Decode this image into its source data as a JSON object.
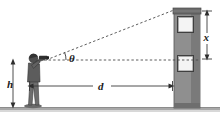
{
  "figure": {
    "background_color": "#ffffff",
    "line_color": "#3a3a3a",
    "ground_color": "#9a9a9a",
    "building_color": "#8a8a8a",
    "building_dark_color": "#6e6e6e",
    "window_color": "#f2f2f2",
    "person_color": "#4a4a4a"
  },
  "labels": {
    "angle": "θ",
    "distance": "d",
    "person_height": "h",
    "building_height": "x"
  },
  "elements": {
    "observer_name": "person-with-surveying-instrument",
    "target_name": "building",
    "ground_name": "ground-line",
    "sightline_name": "line-of-sight",
    "horizontal_name": "horizontal-reference-line"
  },
  "geometry": {
    "eye_point": [
      46,
      60
    ],
    "building_top": [
      174,
      10
    ],
    "horizontal_end": [
      200,
      60
    ],
    "ground_y": 108,
    "building_left": 174,
    "building_right": 200
  }
}
